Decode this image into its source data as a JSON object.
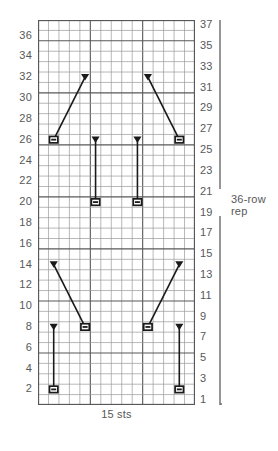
{
  "chart_data": {
    "type": "table",
    "title": "",
    "subtitle": "",
    "xlabel": "15 sts",
    "ylabel": "",
    "grid": true,
    "columns": 15,
    "rows": 37,
    "row_labels_left": [
      "36",
      "34",
      "32",
      "30",
      "28",
      "26",
      "24",
      "22",
      "20",
      "18",
      "16",
      "14",
      "12",
      "10",
      "8",
      "6",
      "4",
      "2"
    ],
    "row_labels_right": [
      "37",
      "35",
      "33",
      "31",
      "29",
      "27",
      "25",
      "23",
      "21",
      "19",
      "17",
      "15",
      "13",
      "11",
      "9",
      "7",
      "5",
      "3",
      "1"
    ],
    "legend": [],
    "annotations": [
      {
        "id": "stitch-count",
        "text": "15 sts",
        "position": "bottom-center"
      },
      {
        "id": "repeat-bracket",
        "text": "36-row\nrep",
        "position": "right"
      }
    ],
    "repeat": {
      "label_line1": "36-row",
      "label_line2": "rep",
      "rows_spanned": 36
    },
    "symbols": [
      {
        "type": "travel-line",
        "from_col": 2,
        "from_row": 2,
        "to_col": 2,
        "to_row": 8,
        "cap_bottom": "purl-bar",
        "cap_top": "triangle"
      },
      {
        "type": "travel-line",
        "from_col": 5,
        "from_row": 8,
        "to_col": 2,
        "to_row": 14,
        "cap_bottom": "purl-bar",
        "cap_top": "triangle"
      },
      {
        "type": "travel-line",
        "from_col": 11,
        "from_row": 8,
        "to_col": 14,
        "to_row": 14,
        "cap_bottom": "purl-bar",
        "cap_top": "triangle"
      },
      {
        "type": "travel-line",
        "from_col": 14,
        "from_row": 2,
        "to_col": 14,
        "to_row": 8,
        "cap_bottom": "purl-bar",
        "cap_top": "triangle"
      },
      {
        "type": "travel-line",
        "from_col": 6,
        "from_row": 20,
        "to_col": 6,
        "to_row": 26,
        "cap_bottom": "purl-bar",
        "cap_top": "triangle"
      },
      {
        "type": "travel-line",
        "from_col": 10,
        "from_row": 20,
        "to_col": 10,
        "to_row": 26,
        "cap_bottom": "purl-bar",
        "cap_top": "triangle"
      },
      {
        "type": "travel-line",
        "from_col": 2,
        "from_row": 26,
        "to_col": 5,
        "to_row": 32,
        "cap_bottom": "purl-bar",
        "cap_top": "triangle"
      },
      {
        "type": "travel-line",
        "from_col": 14,
        "from_row": 26,
        "to_col": 11,
        "to_row": 32,
        "cap_bottom": "purl-bar",
        "cap_top": "triangle"
      }
    ],
    "colors": {
      "grid_minor": "#9a9a9c",
      "grid_major": "#58585a",
      "symbol": "#1a1a1a",
      "text": "#58585a",
      "background": "#ffffff"
    }
  },
  "axis": {
    "bottom_caption": "15 sts"
  },
  "repeat_bracket": {
    "line1": "36-row",
    "line2": "rep"
  }
}
